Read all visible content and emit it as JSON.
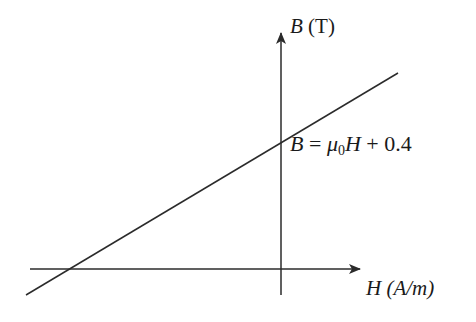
{
  "diagram": {
    "y_axis": {
      "symbol": "B",
      "unit": "(T)"
    },
    "x_axis": {
      "symbol": "H",
      "unit": "(A/m)"
    },
    "equation": {
      "lhs": "B",
      "eq": "=",
      "coef": "μ",
      "coef_sub": "0",
      "var": "H",
      "plus": "+",
      "intercept": "0.4"
    },
    "colors": {
      "line": "#2b2b2b",
      "text": "#1a1a1a",
      "background": "#ffffff"
    }
  }
}
